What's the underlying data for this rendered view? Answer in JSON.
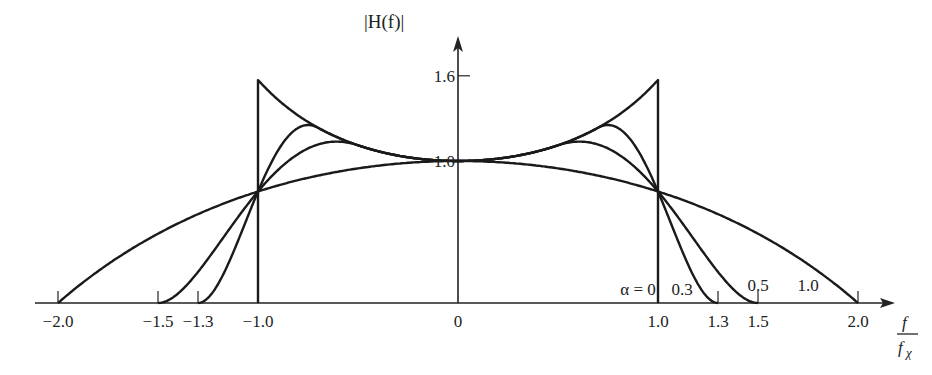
{
  "title": "|H(f)|",
  "x_axis": {
    "label_numerator": "f",
    "label_denominator": "f",
    "label_sub": "χ",
    "ticks": [
      {
        "v": -2.0,
        "label": "−2.0"
      },
      {
        "v": -1.5,
        "label": "−1.5"
      },
      {
        "v": -1.3,
        "label": "−1.3"
      },
      {
        "v": -1.0,
        "label": "−1.0"
      },
      {
        "v": 0,
        "label": "0"
      },
      {
        "v": 1.0,
        "label": "1.0"
      },
      {
        "v": 1.3,
        "label": "1.3"
      },
      {
        "v": 1.5,
        "label": "1.5"
      },
      {
        "v": 2.0,
        "label": "2.0"
      }
    ]
  },
  "y_axis": {
    "label": "|H(f)|",
    "ticks": [
      {
        "v": 1.0,
        "label": "1.0"
      },
      {
        "v": 1.6,
        "label": "1.6"
      }
    ]
  },
  "curve_labels": [
    {
      "text": "α = 0",
      "x": 0.9,
      "y": 0.07
    },
    {
      "text": "0.3",
      "x": 1.12,
      "y": 0.07
    },
    {
      "text": "0.5",
      "x": 1.5,
      "y": 0.1
    },
    {
      "text": "1.0",
      "x": 1.75,
      "y": 0.1
    }
  ],
  "chart_data": {
    "type": "line",
    "title": "|H(f)|",
    "xlabel": "f / fχ",
    "ylabel": "|H(f)|",
    "xlim": [
      -2.1,
      2.2
    ],
    "ylim": [
      0,
      1.75
    ],
    "grid": false,
    "series": [
      {
        "name": "α = 0",
        "edge": 1.0,
        "peak": 1.57,
        "points": [
          [
            -1.0,
            0
          ],
          [
            -1.0,
            1.57
          ],
          [
            -0.5,
            1.11
          ],
          [
            0,
            1.0
          ],
          [
            0.5,
            1.11
          ],
          [
            1.0,
            1.57
          ],
          [
            1.0,
            0
          ]
        ]
      },
      {
        "name": "α = 0.3",
        "edge": 1.3,
        "points": [
          [
            -1.3,
            0
          ],
          [
            -1.0,
            0.79
          ],
          [
            -0.7,
            1.23
          ],
          [
            0,
            1.0
          ],
          [
            0.7,
            1.23
          ],
          [
            1.0,
            0.79
          ],
          [
            1.3,
            0
          ]
        ]
      },
      {
        "name": "α = 0.5",
        "edge": 1.5,
        "points": [
          [
            -1.5,
            0
          ],
          [
            -1.0,
            0.79
          ],
          [
            -0.5,
            1.11
          ],
          [
            0,
            1.0
          ],
          [
            0.5,
            1.11
          ],
          [
            1.0,
            0.79
          ],
          [
            1.5,
            0
          ]
        ]
      },
      {
        "name": "α = 1.0",
        "edge": 2.0,
        "points": [
          [
            -2.0,
            0
          ],
          [
            -1.0,
            0.79
          ],
          [
            0,
            1.0
          ],
          [
            1.0,
            0.79
          ],
          [
            2.0,
            0
          ]
        ]
      }
    ]
  }
}
